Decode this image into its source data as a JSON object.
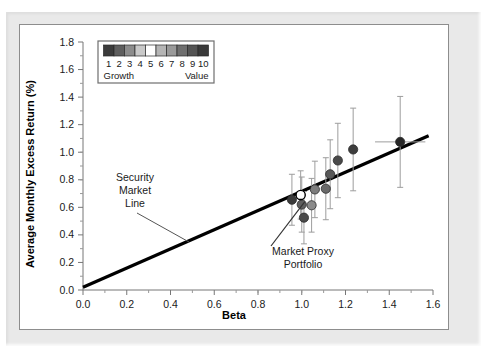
{
  "figure": {
    "background": "#e9e9e9",
    "panel_background": "#ffffff",
    "panel_border": "#8d8d8d"
  },
  "legend": {
    "name": "decile-colorbar-legend",
    "numbers": [
      "1",
      "2",
      "3",
      "4",
      "5",
      "6",
      "7",
      "8",
      "9",
      "10"
    ],
    "left_label": "Growth",
    "right_label": "Value",
    "swatch_colors": [
      "#3b3b3b",
      "#5e5e5e",
      "#8c8c8c",
      "#c9c9c9",
      "#ffffff",
      "#b5b5b5",
      "#9a9a9a",
      "#6f6f6f",
      "#545454",
      "#3a3a3a"
    ],
    "border_color": "#6e6e6e"
  },
  "annotations": [
    {
      "name": "security-market-line-label",
      "lines": [
        "Security",
        "Market",
        "Line"
      ],
      "x": 212,
      "y": 178
    },
    {
      "name": "market-proxy-portfolio-label",
      "lines": [
        "Market Proxy",
        "Portfolio"
      ],
      "x": 325,
      "y": 243
    }
  ],
  "chart_data": {
    "type": "scatter",
    "title": "",
    "xlabel": "Beta",
    "ylabel": "Average Monthly Excess Return (%)",
    "xlim": [
      0.0,
      1.6
    ],
    "ylim": [
      0.0,
      1.8
    ],
    "xticks": [
      "0.0",
      "0.2",
      "0.4",
      "0.6",
      "0.8",
      "1.0",
      "1.2",
      "1.4",
      "1.6"
    ],
    "yticks": [
      "0.0",
      "0.2",
      "0.4",
      "0.6",
      "0.8",
      "1.0",
      "1.2",
      "1.4",
      "1.6",
      "1.8"
    ],
    "xtick_values": [
      0.0,
      0.2,
      0.4,
      0.6,
      0.8,
      1.0,
      1.2,
      1.4,
      1.6
    ],
    "ytick_values": [
      0.0,
      0.2,
      0.4,
      0.6,
      0.8,
      1.0,
      1.2,
      1.4,
      1.6,
      1.8
    ],
    "minor_tick_step": 0.1,
    "grid": false,
    "legend_position": "top-left",
    "series": [
      {
        "name": "Security Market Line",
        "type": "line",
        "color": "#000000",
        "width": 3.2,
        "x": [
          0.0,
          1.58
        ],
        "y": [
          0.02,
          1.12
        ]
      },
      {
        "name": "Book-to-market decile portfolios",
        "type": "scatter",
        "marker": "circle",
        "error_bar_color": "#9d9d9d",
        "points": [
          {
            "label": "1",
            "beta": 0.955,
            "return": 0.655,
            "yerr": 0.185,
            "xerr": 0,
            "color": "#3b3b3b",
            "open": false
          },
          {
            "label": "2",
            "beta": 1.0,
            "return": 0.62,
            "yerr": 0.2,
            "xerr": 0,
            "color": "#5e5e5e",
            "open": false
          },
          {
            "label": "3",
            "beta": 1.01,
            "return": 0.525,
            "yerr": 0.19,
            "xerr": 0,
            "color": "#4a4a4a",
            "open": false
          },
          {
            "label": "4",
            "beta": 1.045,
            "return": 0.615,
            "yerr": 0.195,
            "xerr": 0,
            "color": "#8a8a8a",
            "open": false
          },
          {
            "label": "5",
            "beta": 1.06,
            "return": 0.73,
            "yerr": 0.205,
            "xerr": 0,
            "color": "#7d7d7d",
            "open": false
          },
          {
            "label": "6",
            "beta": 1.11,
            "return": 0.735,
            "yerr": 0.225,
            "xerr": 0,
            "color": "#6a6a6a",
            "open": false
          },
          {
            "label": "7",
            "beta": 1.13,
            "return": 0.84,
            "yerr": 0.25,
            "xerr": 0,
            "color": "#585858",
            "open": false
          },
          {
            "label": "8",
            "beta": 1.165,
            "return": 0.94,
            "yerr": 0.27,
            "xerr": 0,
            "color": "#4a4a4a",
            "open": false
          },
          {
            "label": "9",
            "beta": 1.235,
            "return": 1.02,
            "yerr": 0.3,
            "xerr": 0,
            "color": "#3d3d3d",
            "open": false
          },
          {
            "label": "10",
            "beta": 1.45,
            "return": 1.075,
            "yerr": 0.33,
            "xerr": 0.115,
            "color": "#262626",
            "open": false
          }
        ]
      },
      {
        "name": "Market Proxy Portfolio",
        "type": "scatter",
        "marker": "open-circle",
        "points": [
          {
            "label": "Market Proxy Portfolio",
            "beta": 0.995,
            "return": 0.69,
            "yerr": 0.175,
            "xerr": 0,
            "color": "#ffffff",
            "open": true
          }
        ]
      }
    ]
  }
}
